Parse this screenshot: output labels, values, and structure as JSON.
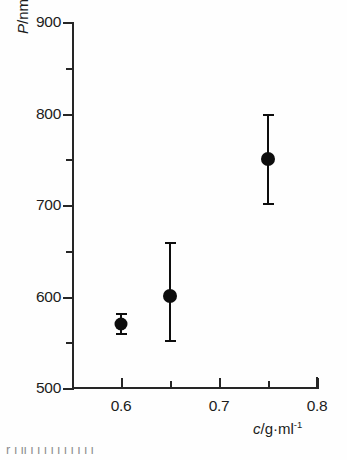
{
  "figure": {
    "background_color": "#fefefe",
    "ink_color": "#1a1a1a",
    "caption_fragment": "r  l  li  i l l l  l   l   l   l     l          l"
  },
  "chart_data": {
    "type": "scatter",
    "title": "",
    "subtitle": "",
    "xlabel": "c/g·ml⁻¹",
    "ylabel": "P/nm",
    "xlabel_parts": {
      "variable": "c",
      "unit": "/g·ml",
      "exponent": "-1"
    },
    "ylabel_parts": {
      "variable": "P",
      "unit": "/nm"
    },
    "xlim": [
      0.55,
      0.8
    ],
    "ylim": [
      500,
      900
    ],
    "grid": false,
    "legend": null,
    "x_major_ticks": [
      0.6,
      0.7,
      0.8
    ],
    "x_major_tick_labels": [
      "0.6",
      "0.7",
      "0.8"
    ],
    "x_minor_ticks": [
      0.55,
      0.65,
      0.75
    ],
    "y_major_ticks": [
      500,
      600,
      700,
      800,
      900
    ],
    "y_major_tick_labels": [
      "500",
      "600",
      "700",
      "800",
      "900"
    ],
    "y_minor_ticks": [
      550,
      650,
      750,
      850
    ],
    "marker": "filled-circle",
    "marker_color": "#0d0d0d",
    "error_bars": "vertical-with-caps",
    "points": [
      {
        "x": 0.6,
        "y": 570,
        "y_low": 558,
        "y_high": 582,
        "err_minus": 12,
        "err_plus": 12
      },
      {
        "x": 0.65,
        "y": 601,
        "y_low": 550,
        "y_high": 660,
        "err_minus": 51,
        "err_plus": 59
      },
      {
        "x": 0.75,
        "y": 750,
        "y_low": 700,
        "y_high": 800,
        "err_minus": 50,
        "err_plus": 50
      }
    ],
    "series": [
      {
        "name": "P vs c",
        "x": [
          0.6,
          0.65,
          0.75
        ],
        "values": [
          570,
          601,
          750
        ],
        "err_low": [
          558,
          550,
          700
        ],
        "err_high": [
          582,
          660,
          800
        ]
      }
    ]
  }
}
